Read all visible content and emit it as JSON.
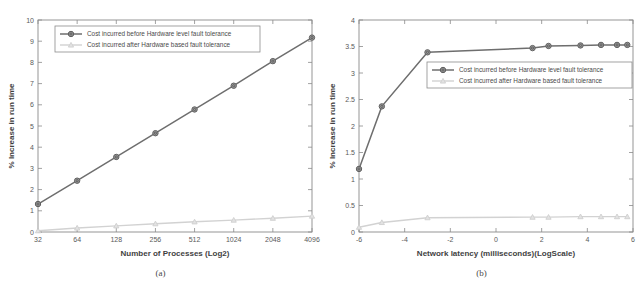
{
  "figure": {
    "panels": [
      {
        "caption": "(a)",
        "xlabel": "Number of Processes (Log2)",
        "ylabel": "% Increase in run time"
      },
      {
        "caption": "(b)",
        "xlabel": "Network latency (milliseconds)(LogScale)",
        "ylabel": "% Increase in run time"
      }
    ]
  },
  "legend": {
    "before_label": "Cost incurred before Hardware level fault tolerance",
    "after_label": "Cost incurred after Hardware based fault tolerance"
  },
  "colors": {
    "series_before": "#6e6e6e",
    "series_after": "#d2d2d2",
    "axis": "#8a8a8a",
    "text": "#4a4a4a",
    "background": "#ffffff"
  },
  "chart_data": [
    {
      "type": "line",
      "title": "",
      "panel": "(a)",
      "xlabel": "Number of Processes (Log2)",
      "ylabel": "% Increase in run time",
      "categories": [
        "32",
        "64",
        "128",
        "256",
        "512",
        "1024",
        "2048",
        "4096"
      ],
      "xtick_labels": [
        "32",
        "64",
        "128",
        "256",
        "512",
        "1024",
        "2048",
        "4096"
      ],
      "ytick_labels": [
        "0",
        "1",
        "2",
        "3",
        "4",
        "5",
        "6",
        "7",
        "8",
        "9",
        "10"
      ],
      "ylim": [
        0,
        10
      ],
      "ytick_step": 1,
      "grid": false,
      "legend_position": "upper-left",
      "series": [
        {
          "name": "Cost incurred before Hardware level fault tolerance",
          "color": "#6e6e6e",
          "marker": "circle",
          "values": [
            1.32,
            2.42,
            3.54,
            4.66,
            5.78,
            6.9,
            8.06,
            9.17
          ]
        },
        {
          "name": "Cost incurred after Hardware based fault tolerance",
          "color": "#d2d2d2",
          "marker": "triangle",
          "values": [
            0.06,
            0.19,
            0.29,
            0.39,
            0.48,
            0.56,
            0.65,
            0.75
          ]
        }
      ]
    },
    {
      "type": "line",
      "title": "",
      "panel": "(b)",
      "xlabel": "Network latency (milliseconds)(LogScale)",
      "ylabel": "% Increase in run time",
      "x": [
        -6,
        -5,
        -3,
        1.6,
        2.3,
        3.7,
        4.6,
        5.3,
        5.75
      ],
      "xtick_labels": [
        "-6",
        "-4",
        "-2",
        "0",
        "2",
        "4",
        "6"
      ],
      "xticks": [
        -6,
        -4,
        -2,
        0,
        2,
        4,
        6
      ],
      "xlim": [
        -6,
        6
      ],
      "ytick_labels": [
        "0",
        "0.5",
        "1",
        "1.5",
        "2",
        "2.5",
        "3",
        "3.5",
        "4"
      ],
      "yticks": [
        0,
        0.5,
        1,
        1.5,
        2,
        2.5,
        3,
        3.5,
        4
      ],
      "ylim": [
        0,
        4
      ],
      "grid": false,
      "legend_position": "center-right",
      "series": [
        {
          "name": "Cost incurred before Hardware level fault tolerance",
          "color": "#6e6e6e",
          "marker": "circle",
          "values": [
            1.19,
            2.37,
            3.39,
            3.47,
            3.51,
            3.52,
            3.53,
            3.53,
            3.53
          ]
        },
        {
          "name": "Cost incurred after Hardware based fault tolerance",
          "color": "#d2d2d2",
          "marker": "triangle",
          "values": [
            0.09,
            0.18,
            0.27,
            0.28,
            0.28,
            0.29,
            0.29,
            0.29,
            0.29
          ]
        }
      ]
    }
  ]
}
